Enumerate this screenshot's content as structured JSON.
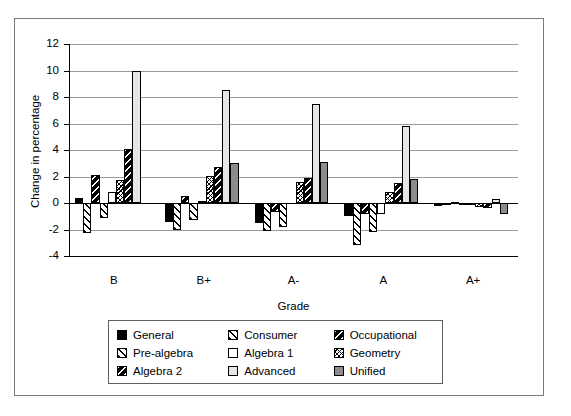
{
  "chart_data": {
    "type": "bar",
    "title": "",
    "xlabel": "Grade",
    "ylabel": "Change in percentage",
    "categories": [
      "B",
      "B+",
      "A-",
      "A",
      "A+"
    ],
    "ylim": [
      -4,
      12
    ],
    "yticks": [
      -4,
      -2,
      0,
      2,
      4,
      6,
      8,
      10,
      12
    ],
    "ytick_labels": [
      "-4",
      "-2",
      "0",
      "2",
      "4",
      "6",
      "8",
      "10",
      "12"
    ],
    "grid": true,
    "legend_position": "bottom",
    "series": [
      {
        "name": "General",
        "fill": "#000000",
        "pattern": "solid",
        "values": [
          0.4,
          -1.4,
          -1.5,
          -1.0,
          -0.2
        ]
      },
      {
        "name": "Consumer",
        "fill": "#ffffff",
        "pattern": "diag-forward",
        "values": [
          -2.3,
          -2.0,
          -2.1,
          -3.2,
          -0.1
        ]
      },
      {
        "name": "Occupational",
        "fill": "#000000",
        "pattern": "diag-back-white",
        "values": [
          2.1,
          0.5,
          -0.7,
          -0.8,
          0.1
        ]
      },
      {
        "name": "Pre-algebra",
        "fill": "#ffffff",
        "pattern": "diag-forward",
        "values": [
          -1.1,
          -1.3,
          -1.8,
          -2.2,
          -0.1
        ]
      },
      {
        "name": "Algebra 1",
        "fill": "#ffffff",
        "pattern": "none",
        "values": [
          0.85,
          0.15,
          0.0,
          -0.85,
          -0.1
        ]
      },
      {
        "name": "Geometry",
        "fill": "#ffffff",
        "pattern": "cross-fine",
        "values": [
          1.75,
          2.05,
          1.6,
          0.85,
          -0.3
        ]
      },
      {
        "name": "Algebra 2",
        "fill": "#000000",
        "pattern": "diag-back-white",
        "values": [
          4.1,
          2.75,
          1.9,
          1.5,
          -0.4
        ]
      },
      {
        "name": "Advanced",
        "fill": "#e6e6e6",
        "pattern": "none",
        "values": [
          10.0,
          8.55,
          7.5,
          5.8,
          0.3
        ]
      },
      {
        "name": "Unified",
        "fill": "#8c8c8c",
        "pattern": "none",
        "values": [
          0.0,
          3.0,
          3.1,
          1.8,
          -0.8
        ]
      }
    ]
  },
  "legend": {
    "rows": [
      [
        "General",
        "Consumer",
        "Occupational"
      ],
      [
        "Pre-algebra",
        "Algebra 1",
        "Geometry"
      ],
      [
        "Algebra 2",
        "Advanced",
        "Unified"
      ]
    ]
  },
  "colors": {
    "black": "#000000",
    "grid": "#9a9a9a",
    "frame": "#7a7a7a",
    "advanced": "#e6e6e6",
    "unified": "#8c8c8c"
  }
}
